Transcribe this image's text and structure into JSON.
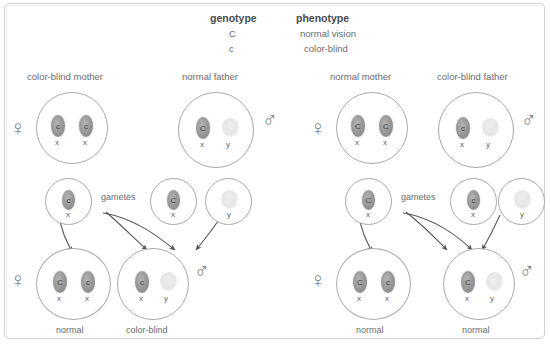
{
  "legend": {
    "genotype_header": "genotype",
    "phenotype_header": "phenotype",
    "rows": [
      {
        "genotype": "C",
        "phenotype": "normal vision"
      },
      {
        "genotype": "c",
        "phenotype": "color-blind"
      }
    ]
  },
  "symbols": {
    "female": "♀",
    "male": "♂"
  },
  "gametes_label_left": "gametes",
  "gametes_label_right": "gametes",
  "left_cross": {
    "parents": [
      {
        "title": "color-blind mother",
        "sex": "female",
        "chromosomes": [
          {
            "allele": "c",
            "letter": "x",
            "type": "x"
          },
          {
            "allele": "c",
            "letter": "x",
            "type": "x"
          }
        ]
      },
      {
        "title": "normal father",
        "sex": "male",
        "chromosomes": [
          {
            "allele": "C",
            "letter": "x",
            "type": "x"
          },
          {
            "allele": "",
            "letter": "y",
            "type": "y"
          }
        ]
      }
    ],
    "gametes": [
      {
        "allele": "c",
        "letter": "x",
        "type": "x"
      },
      {
        "allele": "C",
        "letter": "x",
        "type": "x"
      },
      {
        "allele": "",
        "letter": "y",
        "type": "y"
      }
    ],
    "offspring": [
      {
        "label": "normal",
        "sex": "female",
        "chromosomes": [
          {
            "allele": "C",
            "letter": "x",
            "type": "x"
          },
          {
            "allele": "c",
            "letter": "x",
            "type": "x"
          }
        ]
      },
      {
        "label": "color-blind",
        "sex": "male",
        "chromosomes": [
          {
            "allele": "c",
            "letter": "x",
            "type": "x"
          },
          {
            "allele": "",
            "letter": "y",
            "type": "y"
          }
        ]
      }
    ]
  },
  "right_cross": {
    "parents": [
      {
        "title": "normal mother",
        "sex": "female",
        "chromosomes": [
          {
            "allele": "C",
            "letter": "x",
            "type": "x"
          },
          {
            "allele": "C",
            "letter": "x",
            "type": "x"
          }
        ]
      },
      {
        "title": "color-blind father",
        "sex": "male",
        "chromosomes": [
          {
            "allele": "c",
            "letter": "x",
            "type": "x"
          },
          {
            "allele": "",
            "letter": "y",
            "type": "y"
          }
        ]
      }
    ],
    "gametes": [
      {
        "allele": "C",
        "letter": "x",
        "type": "x"
      },
      {
        "allele": "c",
        "letter": "x",
        "type": "x"
      },
      {
        "allele": "",
        "letter": "y",
        "type": "y"
      }
    ],
    "offspring": [
      {
        "label": "normal",
        "sex": "female",
        "chromosomes": [
          {
            "allele": "C",
            "letter": "x",
            "type": "x"
          },
          {
            "allele": "c",
            "letter": "x",
            "type": "x"
          }
        ]
      },
      {
        "label": "normal",
        "sex": "male",
        "chromosomes": [
          {
            "allele": "C",
            "letter": "x",
            "type": "x"
          },
          {
            "allele": "",
            "letter": "y",
            "type": "y"
          }
        ]
      }
    ]
  },
  "colors": {
    "frame_border": "#d2d2d2",
    "cell_border": "#a9a9a9",
    "x_chromosome": "#959595",
    "y_chromosome": "#ececec",
    "text": "#6b6b6b",
    "arrow": "#555555"
  }
}
